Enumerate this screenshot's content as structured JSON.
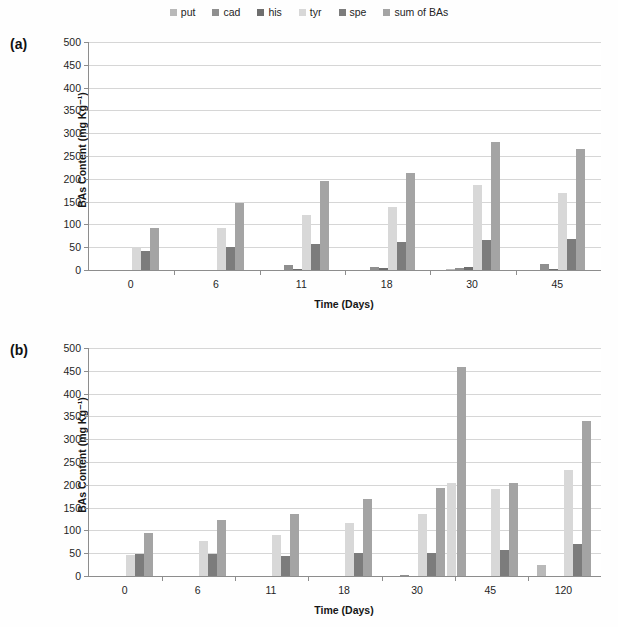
{
  "legend": {
    "items": [
      {
        "label": "put",
        "color": "#b9b9b9"
      },
      {
        "label": "cad",
        "color": "#8f8f8f"
      },
      {
        "label": "his",
        "color": "#6e6e6e"
      },
      {
        "label": "tyr",
        "color": "#d8d8d8"
      },
      {
        "label": "spe",
        "color": "#7c7c7c"
      },
      {
        "label": "sum of BAs",
        "color": "#a4a4a4"
      }
    ]
  },
  "panels": [
    {
      "tag": "(a)",
      "chart_data": {
        "type": "bar",
        "title": "",
        "xlabel": "Time (Days)",
        "ylabel": "BAs Content (mg Kg⁻¹)",
        "ylim": [
          0,
          500
        ],
        "yticks": [
          0,
          50,
          100,
          150,
          200,
          250,
          300,
          350,
          400,
          450,
          500
        ],
        "grid": true,
        "legend_position": "top-center",
        "categories": [
          "0",
          "6",
          "11",
          "18",
          "30",
          "45"
        ],
        "series": [
          {
            "name": "put",
            "values": [
              0,
              0,
              0,
              0,
              2,
              0
            ]
          },
          {
            "name": "cad",
            "values": [
              0,
              0,
              10,
              6,
              5,
              13
            ]
          },
          {
            "name": "his",
            "values": [
              0,
              0,
              3,
              5,
              7,
              3
            ]
          },
          {
            "name": "tyr",
            "values": [
              50,
              93,
              120,
              138,
              186,
              168
            ]
          },
          {
            "name": "spe",
            "values": [
              42,
              50,
              56,
              61,
              66,
              67
            ]
          },
          {
            "name": "sum of BAs",
            "values": [
              93,
              146,
              195,
              213,
              280,
              265
            ]
          }
        ]
      }
    },
    {
      "tag": "(b)",
      "chart_data": {
        "type": "bar",
        "title": "",
        "xlabel": "Time (Days)",
        "ylabel": "BAs Content (mg Kg⁻¹)",
        "ylim": [
          0,
          500
        ],
        "yticks": [
          0,
          50,
          100,
          150,
          200,
          250,
          300,
          350,
          400,
          450,
          500
        ],
        "grid": true,
        "legend_position": "top-center",
        "categories": [
          "0",
          "6",
          "11",
          "18",
          "30",
          "45",
          "120"
        ],
        "series": [
          {
            "name": "put",
            "values": [
              0,
              0,
              0,
              0,
              0,
              0,
              25
            ]
          },
          {
            "name": "cad",
            "values": [
              0,
              0,
              0,
              0,
              3,
              0,
              0
            ]
          },
          {
            "name": "his",
            "values": [
              0,
              0,
              0,
              0,
              0,
              0,
              0
            ]
          },
          {
            "name": "tyr",
            "values": [
              47,
              76,
              90,
              116,
              135,
              190,
              232
            ]
          },
          {
            "name": "spe",
            "values": [
              48,
              48,
              44,
              50,
              50,
              57,
              71
            ]
          },
          {
            "name": "sum of BAs",
            "values": [
              95,
              123,
              136,
              168,
              192,
              204,
              341
            ]
          }
        ]
      }
    },
    {
      "tag": "(b2)",
      "chart_data": {
        "type": "bar",
        "categories": [
          "45b",
          "120b"
        ],
        "series": [
          {
            "name": "tyr2",
            "values": [
              205,
              0
            ]
          },
          {
            "name": "sum of BAs2",
            "values": [
              458,
              0
            ]
          }
        ]
      }
    }
  ]
}
